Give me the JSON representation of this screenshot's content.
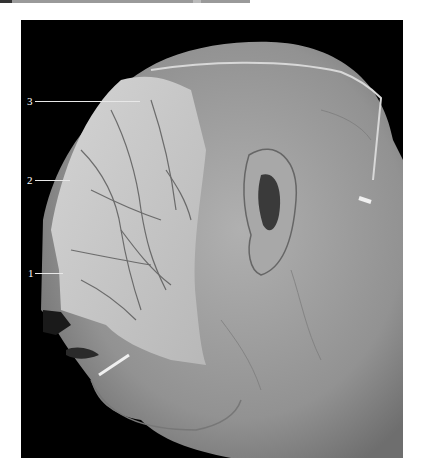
{
  "figure": {
    "colors": {
      "background": "#000000",
      "skin": "#9c9c9c",
      "dissected_region": "#c9c9c9",
      "labels": "#ffffff"
    },
    "labels": [
      {
        "number": "3"
      },
      {
        "number": "2"
      },
      {
        "number": "1"
      }
    ]
  }
}
